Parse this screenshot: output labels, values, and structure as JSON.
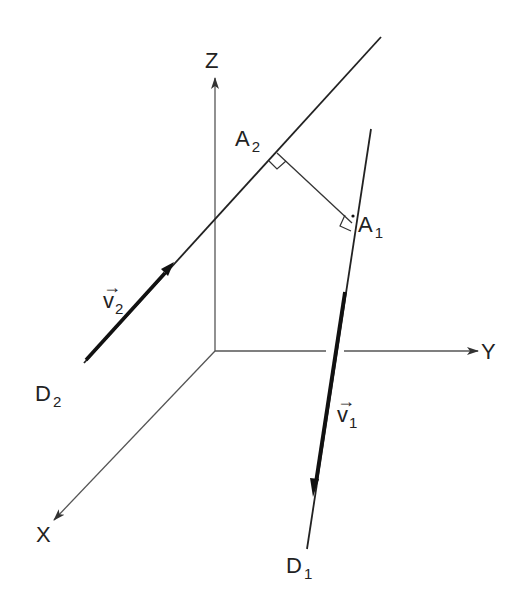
{
  "diagram": {
    "colors": {
      "line": "#222222",
      "axis": "#444444",
      "background": "#ffffff"
    },
    "axes": {
      "x_label": "X",
      "y_label": "Y",
      "z_label": "Z"
    },
    "lines": [
      {
        "name": "D1",
        "label_main": "D",
        "label_sub": "1"
      },
      {
        "name": "D2",
        "label_main": "D",
        "label_sub": "2"
      }
    ],
    "points": [
      {
        "name": "A1",
        "label_main": "A",
        "label_sub": "1"
      },
      {
        "name": "A2",
        "label_main": "A",
        "label_sub": "2"
      }
    ],
    "vectors": [
      {
        "name": "v1",
        "arrow": "→",
        "label_main": "v",
        "label_sub": "1"
      },
      {
        "name": "v2",
        "arrow": "→",
        "label_main": "v",
        "label_sub": "2"
      }
    ]
  }
}
